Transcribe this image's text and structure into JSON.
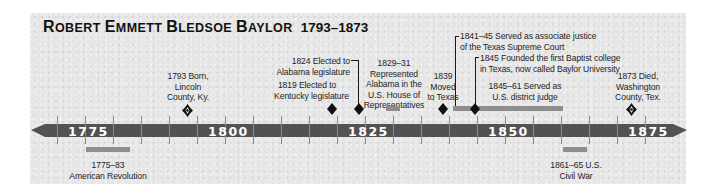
{
  "title": {
    "name_parts": [
      {
        "cap": "R",
        "rest": "OBERT"
      },
      {
        "cap": "E",
        "rest": "MMETT"
      },
      {
        "cap": "B",
        "rest": "LEDSOE"
      },
      {
        "cap": "B",
        "rest": "AYLOR"
      }
    ],
    "name": "Robert Emmett Bledsoe Baylor",
    "years": "1793–1873"
  },
  "timeline": {
    "start_year": 1770,
    "end_year": 1880,
    "axis_labels": [
      "1775",
      "1800",
      "1825",
      "1850",
      "1875"
    ],
    "tick_interval_years": 5,
    "colors": {
      "axis": "#525252",
      "bars": "#8e8e8e",
      "markers": "#111111",
      "background": "#e6e6e6"
    }
  },
  "events": {
    "born": {
      "lines": [
        "1793 Born,",
        "Lincoln",
        "County, Ky."
      ],
      "year": 1793,
      "marker": "ornament-icon"
    },
    "kentucky": {
      "lines": [
        "1819 Elected to",
        "Kentucky legislature"
      ],
      "year": 1819,
      "marker": "diamond-icon"
    },
    "alabama": {
      "lines": [
        "1824 Elected to",
        "Alabama legislature"
      ],
      "year": 1824,
      "marker": "diamond-icon"
    },
    "house": {
      "lines": [
        "1829–31",
        "Represented",
        "Alabama in the",
        "U.S. House of",
        "Representatives"
      ],
      "span": [
        1829,
        1831
      ],
      "marker": "span-bar"
    },
    "texas": {
      "lines": [
        "1839",
        "Moved",
        "to Texas"
      ],
      "year": 1839,
      "marker": "diamond-icon"
    },
    "justice": {
      "lines": [
        "1841–45 Served as associate justice",
        "of the Texas Supreme Court"
      ],
      "span": [
        1841,
        1845
      ],
      "marker": "span-bar"
    },
    "college": {
      "lines": [
        "1845 Founded the first Baptist college",
        "in Texas, now called Baylor University"
      ],
      "year": 1845,
      "marker": "diamond-icon"
    },
    "judge": {
      "lines": [
        "1845–61 Served as",
        "U.S. district judge"
      ],
      "span": [
        1845,
        1861
      ],
      "marker": "span-bar"
    },
    "died": {
      "lines": [
        "1873 Died,",
        "Washington",
        "County, Tex."
      ],
      "year": 1873,
      "marker": "ornament-icon"
    },
    "revolution": {
      "lines": [
        "1775–83",
        "American Revolution"
      ],
      "span": [
        1775,
        1783
      ],
      "marker": "span-bar"
    },
    "civil_war": {
      "lines": [
        "1861–65 U.S.",
        "Civil War"
      ],
      "span": [
        1861,
        1865
      ],
      "marker": "span-bar"
    }
  }
}
